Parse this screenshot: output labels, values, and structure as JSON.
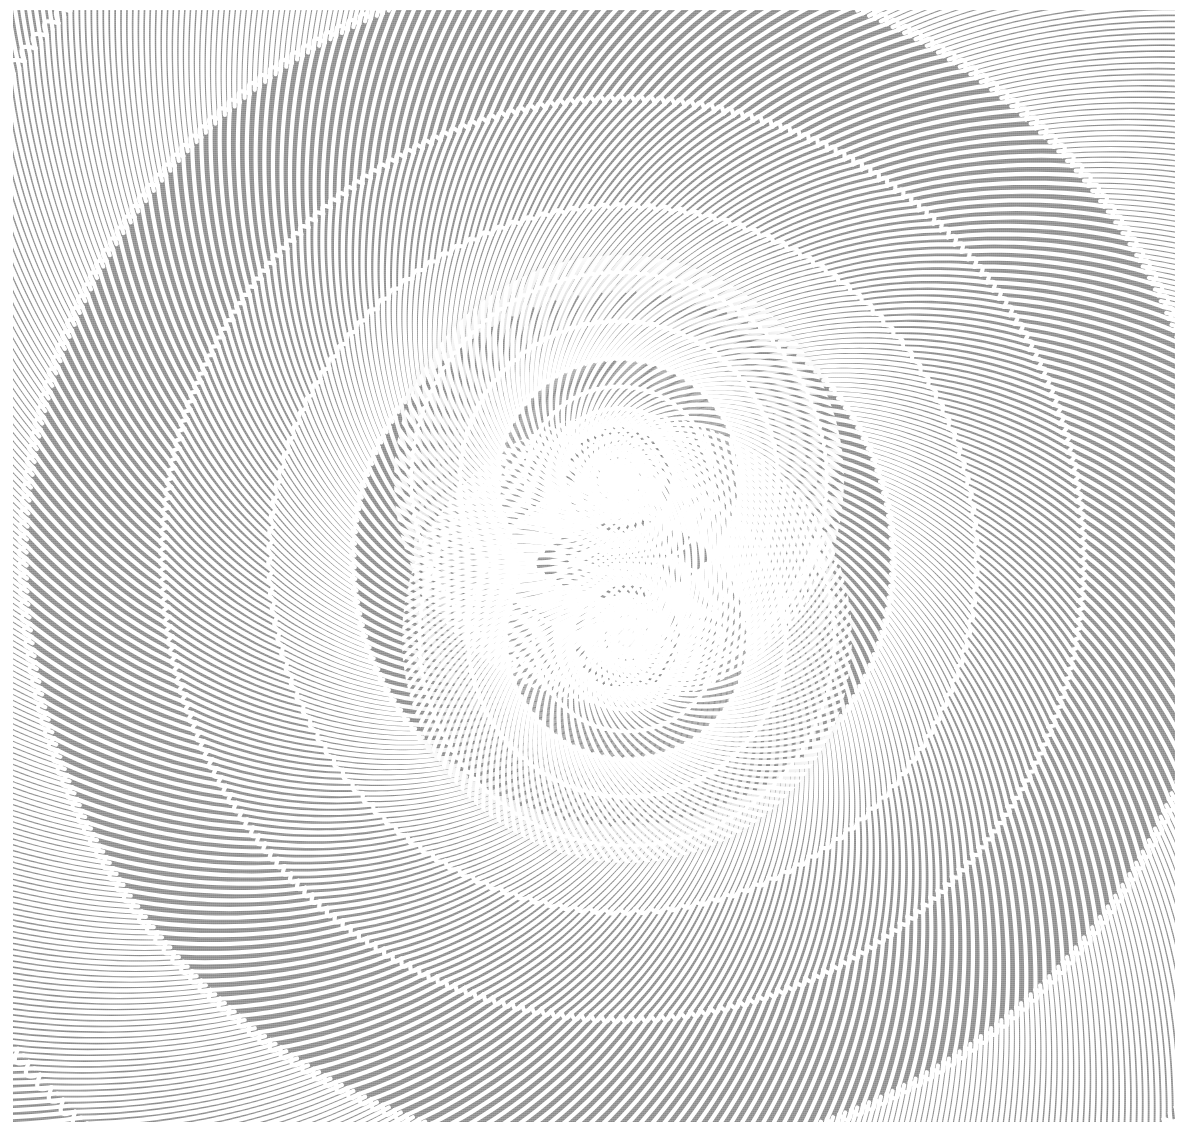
{
  "image": {
    "title": "Double-Centre Spiral Tessellation",
    "kind": "generative-op-art-pattern",
    "width": 1188,
    "height": 1133
  },
  "canvas": {
    "page_background": "#ffffff",
    "plate_background": "#8a8a8a",
    "line_color": "#ffffff",
    "plate": {
      "x": 13,
      "y": 10,
      "width": 1162,
      "height": 1112
    }
  },
  "style": {
    "rib_line_width": 4.2,
    "arc_line_width": 4.2,
    "line_cap": "round",
    "line_join": "round",
    "dither_opacity": 0.3
  },
  "centers": [
    {
      "name": "upper-singularity",
      "x": 619,
      "y": 480,
      "hub_radius": 13
    },
    {
      "name": "lower-singularity",
      "x": 627,
      "y": 638,
      "hub_radius": 8
    }
  ],
  "pattern": {
    "description": "Polar subdivision grid. Concentric rings expand geometrically from each singularity; each ring is cut into angular cells. Cell count halves at pinch/cusp rings, producing converging Y-shaped junctions. Every cell is drawn as a curved chevron: one radial rib plus one circumferential arc, both sheared by a logarithmic twist.",
    "ring_count": 17,
    "base_radius": 11,
    "ring_growth": 1.305,
    "sectors_innermost": 18,
    "twist_per_ring_deg": 13.5,
    "cusp_rings": [
      4,
      7,
      10,
      13,
      16
    ],
    "arc_bow": 0.22,
    "rib_bow": 0.3,
    "max_radius": 1750,
    "blend_band": 150
  },
  "chart_data": {
    "type": "line",
    "title": "Double-Centre Spiral Tessellation",
    "xlabel": "",
    "ylabel": "",
    "grid": false,
    "legend_position": "none",
    "xlim": [
      0,
      1188
    ],
    "ylim": [
      0,
      1133
    ],
    "annotations": [
      "Two radial singularities where all ribs converge",
      "Cusp rings where sector count halves outward",
      "Logarithmic twist applied per ring"
    ],
    "series": [
      {
        "name": "upper-singularity-field",
        "center": [
          619,
          480
        ],
        "rings": 17,
        "base_radius": 11,
        "growth": 1.305,
        "sectors_innermost": 18,
        "twist_deg": 13.5,
        "cusp_rings": [
          4,
          7,
          10,
          13,
          16
        ]
      },
      {
        "name": "lower-singularity-field",
        "center": [
          627,
          638
        ],
        "rings": 17,
        "base_radius": 11,
        "growth": 1.305,
        "sectors_innermost": 18,
        "twist_deg": 13.5,
        "cusp_rings": [
          4,
          7,
          10,
          13,
          16
        ]
      }
    ]
  }
}
